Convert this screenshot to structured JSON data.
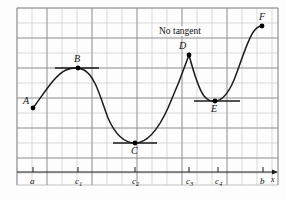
{
  "figure": {
    "title": "",
    "annotation": "No tangent",
    "axis_label_x": "x"
  },
  "colors": {
    "grid": "#c9c9c9",
    "grid_major": "#8c8c8c",
    "curve": "#1a1a1a",
    "axis": "#1a1a1a",
    "tangent": "#1a1a1a",
    "point": "#000000",
    "background": "#fdfdfd",
    "border": "#b5b5b5"
  },
  "chart_data": {
    "type": "line",
    "title": "",
    "xlabel": "x",
    "ylabel": "",
    "grid": true,
    "legend": "none",
    "xlim": [
      17,
      278
    ],
    "ylim": [
      8,
      185
    ],
    "grid_spacing": 15,
    "axis_y_pixel": 172,
    "points": [
      {
        "label": "A",
        "x": 33,
        "y": 108,
        "label_dx": -10,
        "label_dy": -12,
        "tangent": false,
        "note": "endpoint"
      },
      {
        "label": "B",
        "x": 78,
        "y": 68,
        "label_dx": -4,
        "label_dy": -14,
        "tangent": true,
        "tangent_x1": 55,
        "tangent_x2": 99,
        "note": "local maximum, horizontal tangent"
      },
      {
        "label": "C",
        "x": 135,
        "y": 143,
        "label_dx": -4,
        "label_dy": 3,
        "tangent": true,
        "tangent_x1": 113,
        "tangent_x2": 157,
        "note": "local minimum, horizontal tangent"
      },
      {
        "label": "D",
        "x": 189,
        "y": 55,
        "label_dx": -10,
        "label_dy": -14,
        "tangent": false,
        "note": "corner / cusp, no tangent"
      },
      {
        "label": "E",
        "x": 215,
        "y": 101,
        "label_dx": -4,
        "label_dy": 3,
        "tangent": true,
        "tangent_x1": 194,
        "tangent_x2": 240,
        "note": "local minimum, horizontal tangent"
      },
      {
        "label": "F",
        "x": 262,
        "y": 26,
        "label_dx": -3,
        "label_dy": -14,
        "tangent": false,
        "note": "endpoint"
      }
    ],
    "x_ticks": [
      {
        "label": "a",
        "sub": "",
        "x": 33
      },
      {
        "label": "c",
        "sub": "1",
        "x": 78
      },
      {
        "label": "c",
        "sub": "2",
        "x": 135
      },
      {
        "label": "c",
        "sub": "3",
        "x": 189
      },
      {
        "label": "c",
        "sub": "4",
        "x": 218
      },
      {
        "label": "b",
        "sub": "",
        "x": 263
      }
    ],
    "curve_path": "M 33 108 C 45 92, 55 75, 66 70 C 73 67, 78 67, 84 70 C 95 76, 100 96, 108 118 C 115 134, 124 143, 135 143 C 147 143, 158 130, 168 108 C 176 90, 183 72, 189 55 C 193 70, 198 88, 204 96 C 208 101, 211 101, 215 101 C 222 101, 228 94, 234 80 C 241 63, 247 40, 254 31 C 257 27, 260 26, 262 26",
    "annotations": [
      {
        "text": "No tangent",
        "x": 158,
        "y": 26,
        "points_to": "D"
      }
    ]
  }
}
